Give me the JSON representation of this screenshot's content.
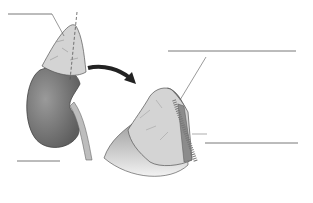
{
  "diagram": {
    "labels": [
      {
        "id": "label-top-left",
        "text": ""
      },
      {
        "id": "label-bottom-left",
        "text": ""
      },
      {
        "id": "label-right-top",
        "text": ""
      },
      {
        "id": "label-right-middle",
        "text": ""
      }
    ],
    "colors": {
      "kidney": "#7a7a7a",
      "adrenal": "#d4d4d4",
      "medulla": "#8c8c8c",
      "line": "#555555",
      "arrow": "#222222"
    }
  }
}
